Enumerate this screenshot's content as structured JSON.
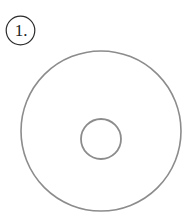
{
  "page": {
    "background_color": "#ffffff",
    "width": 192,
    "height": 224
  },
  "label": {
    "text": "1.",
    "shape": "circle",
    "text_color": "#1b1b1b",
    "ring_color": "#2b2b2b"
  },
  "figure": {
    "name": "disc",
    "stroke_color": "#8c8c8c",
    "fill_color": "none",
    "outer_circle": {
      "center_x": 101,
      "center_y": 131,
      "radius": 80,
      "stroke_width": 1.6
    },
    "inner_circle": {
      "center_x": 101,
      "center_y": 139,
      "radius": 20,
      "stroke_width": 1.8
    }
  }
}
